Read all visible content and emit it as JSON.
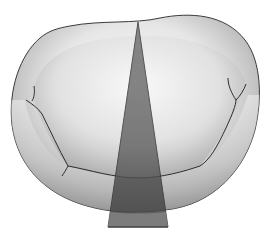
{
  "figure": {
    "elements": [
      "annulus-ring",
      "anterior-leaflet",
      "posterior-leaflet",
      "commissure-left",
      "commissure-right",
      "imaging-plane-wedge"
    ]
  },
  "colors": {
    "background": "#ffffff",
    "outline": "#3a3a3a",
    "valve_light": "#f4f4f4",
    "valve_mid": "#c8c8c8",
    "valve_dark": "#8a8a8a",
    "wedge_upper": "#6e6e6e",
    "wedge_mid": "#5a5a5a",
    "wedge_low": "#7c7c7c"
  }
}
